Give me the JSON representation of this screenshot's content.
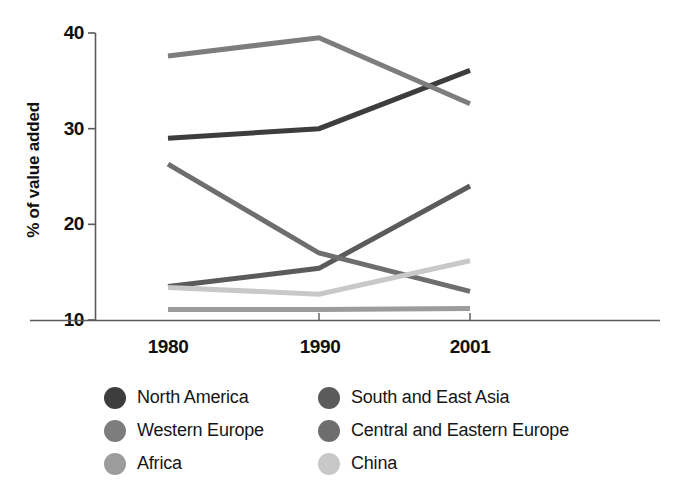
{
  "chart_data": {
    "type": "line",
    "title": "",
    "xlabel": "",
    "ylabel": "% of value added",
    "x": [
      "1980",
      "1990",
      "2001"
    ],
    "categories": [
      "1980",
      "1990",
      "2001"
    ],
    "ylim": [
      10,
      40
    ],
    "xlim": [
      1980,
      2001
    ],
    "yticks": [
      "10",
      "20",
      "30",
      "40"
    ],
    "ytick_values": [
      10,
      20,
      30,
      40
    ],
    "xticks": [
      "1980",
      "1990",
      "2001"
    ],
    "grid": false,
    "legend_position": "below-plot-two-columns",
    "series": [
      {
        "name": "North America",
        "color": "#3d3d3d",
        "values": [
          29.0,
          30.0,
          36.1
        ]
      },
      {
        "name": "Western Europe",
        "color": "#7d7d7d",
        "values": [
          37.6,
          39.5,
          32.6
        ]
      },
      {
        "name": "Africa",
        "color": "#9c9c9c",
        "values": [
          11.1,
          11.1,
          11.2
        ]
      },
      {
        "name": "South and East Asia",
        "color": "#5b5b5b",
        "values": [
          13.5,
          15.4,
          24.0
        ]
      },
      {
        "name": "Central and Eastern Europe",
        "color": "#6e6e6e",
        "values": [
          26.3,
          17.0,
          13.0
        ]
      },
      {
        "name": "China",
        "color": "#c8c8c8",
        "values": [
          13.4,
          12.7,
          16.2
        ]
      }
    ]
  },
  "legend": {
    "items": [
      {
        "label": "North America",
        "color": "#3d3d3d"
      },
      {
        "label": "South and East Asia",
        "color": "#5b5b5b"
      },
      {
        "label": "Western Europe",
        "color": "#7d7d7d"
      },
      {
        "label": "Central and Eastern Europe",
        "color": "#6e6e6e"
      },
      {
        "label": "Africa",
        "color": "#9c9c9c"
      },
      {
        "label": "China",
        "color": "#c8c8c8"
      }
    ]
  },
  "axes": {
    "y_title": "% of value added",
    "y_ticks": [
      "40",
      "30",
      "20",
      "10"
    ],
    "x_ticks": [
      "1980",
      "1990",
      "2001"
    ]
  },
  "colors": {
    "axis": "#5a5a5a",
    "text": "#111111",
    "background": "#ffffff"
  }
}
